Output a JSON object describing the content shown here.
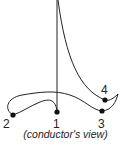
{
  "diagram": {
    "type": "conducting-pattern",
    "beats": [
      {
        "label": "1",
        "x": 57,
        "y": 112
      },
      {
        "label": "2",
        "x": 13,
        "y": 115
      },
      {
        "label": "3",
        "x": 102,
        "y": 111
      },
      {
        "label": "4",
        "x": 105,
        "y": 100
      }
    ],
    "caption": "(conductor's view)",
    "stroke_color": "#222222"
  }
}
